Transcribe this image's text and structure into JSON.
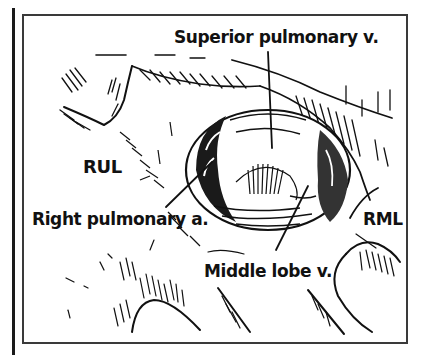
{
  "figure": {
    "type": "surgical anatomical line illustration",
    "frame_color": "#3a3a3a",
    "ink_color": "#111111",
    "background_color": "#ffffff"
  },
  "labels": {
    "superior_pulmonary_vein": "Superior pulmonary v.",
    "rul": "RUL",
    "right_pulmonary_artery": "Right pulmonary a.",
    "rml": "RML",
    "middle_lobe_vein": "Middle lobe v."
  }
}
